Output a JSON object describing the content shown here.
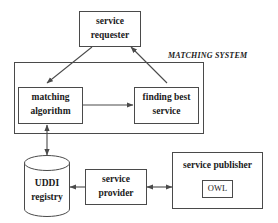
{
  "diagram": {
    "title_label": "MATCHING SYSTEM",
    "background_color": "#ffffff",
    "stroke_color": "#4a4a4a",
    "text_color": "#1a1a1a",
    "nodes": {
      "service_requester": {
        "line1": "service",
        "line2": "requester",
        "shape": "rectangle"
      },
      "matching_algorithm": {
        "line1": "matching",
        "line2": "algorithm",
        "shape": "rectangle"
      },
      "finding_best_service": {
        "line1": "finding best",
        "line2": "service",
        "shape": "rectangle"
      },
      "uddi_registry": {
        "line1": "UDDI",
        "line2": "registry",
        "shape": "cylinder"
      },
      "service_provider": {
        "line1": "service",
        "line2": "provider",
        "shape": "rectangle"
      },
      "service_publisher": {
        "line1": "service publisher",
        "shape": "rectangle"
      },
      "owl": {
        "line1": "OWL",
        "shape": "rectangle"
      }
    },
    "edges": [
      {
        "name": "requester-to-matching-algorithm",
        "from": "service_requester",
        "to": "matching_algorithm",
        "direction": "one-way"
      },
      {
        "name": "finding-best-service-to-requester",
        "from": "finding_best_service",
        "to": "service_requester",
        "direction": "one-way"
      },
      {
        "name": "matching-algorithm-to-finding-best-service",
        "from": "matching_algorithm",
        "to": "finding_best_service",
        "direction": "one-way"
      },
      {
        "name": "uddi-registry-to-matching-algorithm",
        "from": "uddi_registry",
        "to": "matching_algorithm",
        "direction": "two-way"
      },
      {
        "name": "service-provider-to-uddi-registry",
        "from": "service_provider",
        "to": "uddi_registry",
        "direction": "one-way"
      },
      {
        "name": "service-provider-to-service-publisher",
        "from": "service_provider",
        "to": "service_publisher",
        "direction": "two-way"
      }
    ]
  }
}
